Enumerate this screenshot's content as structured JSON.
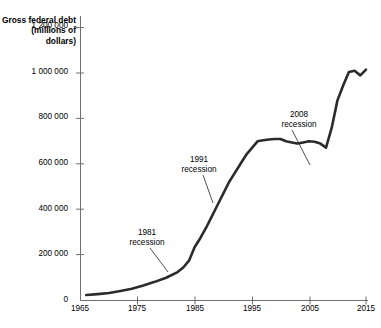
{
  "bleed": {
    "text": " "
  },
  "chart_data": {
    "type": "line",
    "title": "",
    "ylabel": "Gross federal debt (millions of dollars)",
    "xlabel": "",
    "xlim": [
      1965,
      2016
    ],
    "ylim": [
      0,
      1280000
    ],
    "grid": false,
    "legend": "none",
    "x_ticks": [
      "1965",
      "1975",
      "1985",
      "1995",
      "2005",
      "2015"
    ],
    "x_tick_values": [
      1965,
      1975,
      1985,
      1995,
      2005,
      2015
    ],
    "y_ticks": [
      "0",
      "200 000",
      "400 000",
      "600 000",
      "800 000",
      "1 000 000",
      "1 200 000"
    ],
    "y_tick_values": [
      0,
      200000,
      400000,
      600000,
      800000,
      1000000,
      1200000
    ],
    "series": [
      {
        "name": "Gross federal debt",
        "color": "#2b2b2b",
        "x": [
          1966,
          1968,
          1970,
          1972,
          1974,
          1976,
          1978,
          1980,
          1982,
          1983,
          1984,
          1985,
          1986,
          1987,
          1988,
          1989,
          1990,
          1991,
          1992,
          1993,
          1994,
          1995,
          1996,
          1997,
          1998,
          1999,
          2000,
          2001,
          2002,
          2003,
          2004,
          2005,
          2006,
          2007,
          2008,
          2009,
          2010,
          2011,
          2012,
          2013,
          2014,
          2015
        ],
        "y": [
          24000,
          28000,
          33000,
          42000,
          52000,
          66000,
          82000,
          100000,
          125000,
          145000,
          175000,
          235000,
          275000,
          320000,
          370000,
          420000,
          470000,
          520000,
          560000,
          600000,
          640000,
          670000,
          700000,
          705000,
          708000,
          710000,
          710000,
          700000,
          695000,
          690000,
          695000,
          700000,
          698000,
          690000,
          672000,
          760000,
          880000,
          945000,
          1005000,
          1010000,
          990000,
          1015000
        ]
      }
    ],
    "annotations": [
      {
        "label_line1": "1981",
        "label_line2": "recession",
        "year": 1983,
        "value": 140000
      },
      {
        "label_line1": "1991",
        "label_line2": "recession",
        "year": 1992,
        "value": 555000
      },
      {
        "label_line1": "2008",
        "label_line2": "recession",
        "year": 2008,
        "value": 675000
      }
    ]
  }
}
